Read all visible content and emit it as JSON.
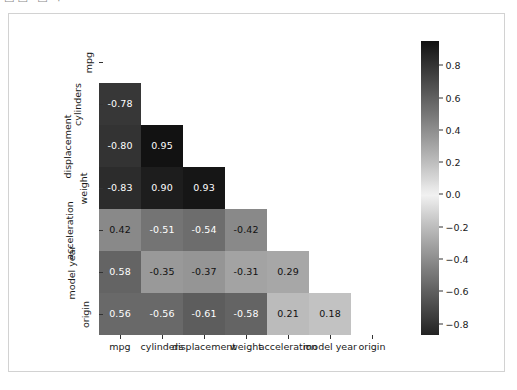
{
  "toolbar": {
    "glyph_fragment": "▭▭ ▭ ⌐"
  },
  "chart_data": {
    "type": "heatmap",
    "title": "",
    "xlabel": "",
    "ylabel": "",
    "grid": false,
    "legend_position": "right",
    "annotated": true,
    "mask": "lower-triangle",
    "categories": [
      "mpg",
      "cylinders",
      "displacement",
      "weight",
      "acceleration",
      "model year",
      "origin"
    ],
    "x_tick_labels": [
      "mpg",
      "cylinders",
      "displacement",
      "weight",
      "acceleration",
      "model year",
      "origin"
    ],
    "y_tick_labels": [
      "mpg",
      "cylinders",
      "displacement",
      "weight",
      "acceleration",
      "model year",
      "origin"
    ],
    "matrix": [
      [
        null,
        null,
        null,
        null,
        null,
        null,
        null
      ],
      [
        "-0.78",
        null,
        null,
        null,
        null,
        null,
        null
      ],
      [
        "-0.80",
        "0.95",
        null,
        null,
        null,
        null,
        null
      ],
      [
        "-0.83",
        "0.90",
        "0.93",
        null,
        null,
        null,
        null
      ],
      [
        "0.42",
        "-0.51",
        "-0.54",
        "-0.42",
        null,
        null,
        null
      ],
      [
        "0.58",
        "-0.35",
        "-0.37",
        "-0.31",
        "0.29",
        null,
        null
      ],
      [
        "0.56",
        "-0.56",
        "-0.61",
        "-0.58",
        "0.21",
        "0.18",
        null
      ]
    ],
    "values": [
      [
        null,
        null,
        null,
        null,
        null,
        null,
        null
      ],
      [
        -0.78,
        null,
        null,
        null,
        null,
        null,
        null
      ],
      [
        -0.8,
        0.95,
        null,
        null,
        null,
        null,
        null
      ],
      [
        -0.83,
        0.9,
        0.93,
        null,
        null,
        null,
        null
      ],
      [
        0.42,
        -0.51,
        -0.54,
        -0.42,
        null,
        null,
        null
      ],
      [
        0.58,
        -0.35,
        -0.37,
        -0.31,
        0.29,
        null,
        null
      ],
      [
        0.56,
        -0.56,
        -0.61,
        -0.58,
        0.21,
        0.18,
        null
      ]
    ],
    "colorbar": {
      "ticks": [
        "0.8",
        "0.6",
        "0.4",
        "0.2",
        "0.0",
        "-0.2",
        "-0.4",
        "-0.6",
        "-0.8"
      ],
      "tick_values": [
        0.8,
        0.6,
        0.4,
        0.2,
        0.0,
        -0.2,
        -0.4,
        -0.6,
        -0.8
      ],
      "vmax": 0.95,
      "vmin": -0.87,
      "colormap": "diverging-gray"
    },
    "colors": {
      "cell_dark": "#161616",
      "cell_mid": "#f2f2f2",
      "background": "#ffffff",
      "frame": "#d2d2d2",
      "tick": "#333333",
      "text_on_dark": "#ffffff",
      "text_on_light": "#111111"
    }
  }
}
